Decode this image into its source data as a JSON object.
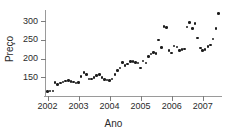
{
  "chart_data": {
    "type": "scatter",
    "title": "",
    "xlabel": "Ano",
    "ylabel": "Preço",
    "xlim": [
      2001.92,
      2007.62
    ],
    "ylim": [
      100,
      330
    ],
    "xticks": [
      2002,
      2003,
      2004,
      2005,
      2006,
      2007
    ],
    "xtick_labels": [
      "2002",
      "2003",
      "2004",
      "2005",
      "2006",
      "2007"
    ],
    "yticks": [
      150,
      200,
      250,
      300
    ],
    "ytick_labels": [
      "150",
      "200",
      "250",
      "300"
    ],
    "grid": false,
    "legend": null,
    "marker": "filled-circle",
    "marker_color": "#1c1c1c",
    "axis_color": "#9a9a9a",
    "series": [
      {
        "name": "Preço",
        "points": [
          [
            2002.0,
            112
          ],
          [
            2002.08,
            113
          ],
          [
            2002.17,
            114
          ],
          [
            2002.25,
            136
          ],
          [
            2002.33,
            131
          ],
          [
            2002.42,
            135
          ],
          [
            2002.5,
            138
          ],
          [
            2002.58,
            140
          ],
          [
            2002.67,
            141
          ],
          [
            2002.75,
            139
          ],
          [
            2002.83,
            137
          ],
          [
            2002.92,
            135
          ],
          [
            2003.0,
            136
          ],
          [
            2003.08,
            152
          ],
          [
            2003.17,
            163
          ],
          [
            2003.25,
            158
          ],
          [
            2003.33,
            146
          ],
          [
            2003.42,
            145
          ],
          [
            2003.5,
            150
          ],
          [
            2003.58,
            155
          ],
          [
            2003.67,
            158
          ],
          [
            2003.75,
            150
          ],
          [
            2003.83,
            144
          ],
          [
            2003.92,
            143
          ],
          [
            2004.0,
            142
          ],
          [
            2004.08,
            146
          ],
          [
            2004.17,
            158
          ],
          [
            2004.25,
            168
          ],
          [
            2004.33,
            175
          ],
          [
            2004.42,
            190
          ],
          [
            2004.5,
            182
          ],
          [
            2004.58,
            186
          ],
          [
            2004.67,
            192
          ],
          [
            2004.75,
            192
          ],
          [
            2004.83,
            190
          ],
          [
            2004.92,
            188
          ],
          [
            2005.0,
            175
          ],
          [
            2005.08,
            193
          ],
          [
            2005.17,
            188
          ],
          [
            2005.25,
            205
          ],
          [
            2005.33,
            212
          ],
          [
            2005.42,
            216
          ],
          [
            2005.5,
            214
          ],
          [
            2005.58,
            250
          ],
          [
            2005.67,
            230
          ],
          [
            2005.75,
            286
          ],
          [
            2005.83,
            283
          ],
          [
            2005.92,
            222
          ],
          [
            2006.0,
            215
          ],
          [
            2006.08,
            234
          ],
          [
            2006.17,
            231
          ],
          [
            2006.25,
            222
          ],
          [
            2006.33,
            224
          ],
          [
            2006.42,
            226
          ],
          [
            2006.5,
            285
          ],
          [
            2006.58,
            296
          ],
          [
            2006.67,
            280
          ],
          [
            2006.75,
            294
          ],
          [
            2006.83,
            255
          ],
          [
            2006.92,
            228
          ],
          [
            2007.0,
            222
          ],
          [
            2007.08,
            225
          ],
          [
            2007.17,
            232
          ],
          [
            2007.25,
            236
          ],
          [
            2007.33,
            252
          ],
          [
            2007.42,
            280
          ],
          [
            2007.5,
            320
          ]
        ]
      }
    ]
  }
}
